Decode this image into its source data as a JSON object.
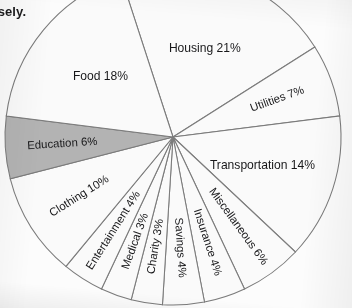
{
  "document": {
    "partial_text_top_left": "isely."
  },
  "chart_data": {
    "type": "pie",
    "title": "",
    "subtitle": "",
    "xlabel": "",
    "ylabel": "",
    "legend_position": "none",
    "grid": false,
    "units": "percent",
    "total": 100,
    "start_angle_deg": -18,
    "direction": "clockwise",
    "categories": [
      "Housing",
      "Utilities",
      "Transportation",
      "Miscellaneous",
      "Insurance",
      "Savings",
      "Charity",
      "Medical",
      "Entertainment",
      "Clothing",
      "Education",
      "Food"
    ],
    "values": [
      21,
      7,
      14,
      6,
      4,
      4,
      3,
      3,
      4,
      10,
      6,
      18
    ],
    "labels": [
      "Housing 21%",
      "Utilities 7%",
      "Transportation 14%",
      "Miscellaneous 6%",
      "Insurance 4%",
      "Savings 4%",
      "Charity 3%",
      "Medical 3%",
      "Entertainment 4%",
      "Clothing 10%",
      "Education 6%",
      "Food 18%"
    ],
    "slices": [
      {
        "name": "Housing",
        "value": 21,
        "label": "Housing 21%",
        "fill": "#fafafa",
        "highlighted": false,
        "orientation": "horizontal"
      },
      {
        "name": "Utilities",
        "value": 7,
        "label": "Utilities 7%",
        "fill": "#fafafa",
        "highlighted": false,
        "orientation": "radial"
      },
      {
        "name": "Transportation",
        "value": 14,
        "label": "Transportation 14%",
        "fill": "#fafafa",
        "highlighted": false,
        "orientation": "horizontal"
      },
      {
        "name": "Miscellaneous",
        "value": 6,
        "label": "Miscellaneous 6%",
        "fill": "#fafafa",
        "highlighted": false,
        "orientation": "radial"
      },
      {
        "name": "Insurance",
        "value": 4,
        "label": "Insurance 4%",
        "fill": "#fafafa",
        "highlighted": false,
        "orientation": "radial"
      },
      {
        "name": "Savings",
        "value": 4,
        "label": "Savings 4%",
        "fill": "#fafafa",
        "highlighted": false,
        "orientation": "radial"
      },
      {
        "name": "Charity",
        "value": 3,
        "label": "Charity 3%",
        "fill": "#fafafa",
        "highlighted": false,
        "orientation": "radial"
      },
      {
        "name": "Medical",
        "value": 3,
        "label": "Medical 3%",
        "fill": "#fafafa",
        "highlighted": false,
        "orientation": "radial"
      },
      {
        "name": "Entertainment",
        "value": 4,
        "label": "Entertainment 4%",
        "fill": "#fafafa",
        "highlighted": false,
        "orientation": "radial"
      },
      {
        "name": "Clothing",
        "value": 10,
        "label": "Clothing 10%",
        "fill": "#fafafa",
        "highlighted": false,
        "orientation": "radial"
      },
      {
        "name": "Education",
        "value": 6,
        "label": "Education 6%",
        "fill": "#b3b3b3",
        "highlighted": true,
        "orientation": "radial"
      },
      {
        "name": "Food",
        "value": 18,
        "label": "Food 18%",
        "fill": "#fafafa",
        "highlighted": false,
        "orientation": "horizontal"
      }
    ],
    "colors": {
      "slice_default_fill": "#fafafa",
      "slice_highlight_fill": "#b3b3b3",
      "slice_stroke": "#7b7b7b",
      "label_text": "#18181a",
      "background": "#fcfcfc"
    },
    "geometry": {
      "center_x": 173,
      "center_y": 137,
      "radius": 168,
      "cropped_top": true
    }
  }
}
